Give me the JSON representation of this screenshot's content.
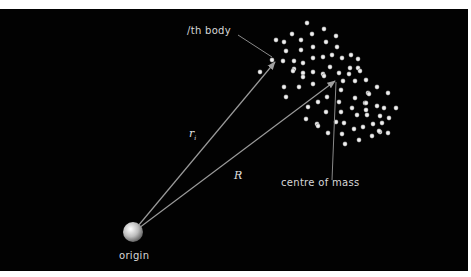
{
  "diagram": {
    "labels": {
      "ith_body": "/th body",
      "centre_of_mass": "centre of mass",
      "origin": "origin",
      "r_i": "r",
      "r_i_sub": "i",
      "R": "R"
    },
    "colors": {
      "background": "#020202",
      "border": "#ffffff",
      "vector": "#9a9a9a",
      "particle": "#e6e6e6",
      "text": "#d8d8d8"
    },
    "particles": [
      [
        307,
        23
      ],
      [
        292,
        34
      ],
      [
        301,
        40
      ],
      [
        276,
        40
      ],
      [
        284,
        42
      ],
      [
        312,
        34
      ],
      [
        286,
        51
      ],
      [
        301,
        50
      ],
      [
        272,
        60
      ],
      [
        283,
        61
      ],
      [
        294,
        61
      ],
      [
        303,
        63
      ],
      [
        260,
        72
      ],
      [
        294,
        69
      ],
      [
        303,
        73
      ],
      [
        313,
        47
      ],
      [
        313,
        58
      ],
      [
        313,
        72
      ],
      [
        324,
        29
      ],
      [
        336,
        36
      ],
      [
        326,
        42
      ],
      [
        337,
        47
      ],
      [
        323,
        57
      ],
      [
        332,
        55
      ],
      [
        342,
        58
      ],
      [
        351,
        55
      ],
      [
        358,
        59
      ],
      [
        330,
        67
      ],
      [
        350,
        68
      ],
      [
        358,
        68
      ],
      [
        323,
        74
      ],
      [
        339,
        73
      ],
      [
        293,
        71
      ],
      [
        303,
        77
      ],
      [
        284,
        87
      ],
      [
        299,
        87
      ],
      [
        313,
        84
      ],
      [
        286,
        97
      ],
      [
        308,
        107
      ],
      [
        306,
        119
      ],
      [
        324,
        76
      ],
      [
        349,
        74
      ],
      [
        360,
        71
      ],
      [
        343,
        81
      ],
      [
        355,
        81
      ],
      [
        366,
        80
      ],
      [
        341,
        90
      ],
      [
        368,
        93
      ],
      [
        318,
        102
      ],
      [
        327,
        97
      ],
      [
        339,
        102
      ],
      [
        355,
        98
      ],
      [
        352,
        108
      ],
      [
        365,
        103
      ],
      [
        326,
        112
      ],
      [
        341,
        112
      ],
      [
        357,
        115
      ],
      [
        367,
        115
      ],
      [
        317,
        124
      ],
      [
        336,
        122
      ],
      [
        344,
        123
      ],
      [
        363,
        127
      ],
      [
        354,
        129
      ],
      [
        377,
        87
      ],
      [
        369,
        94
      ],
      [
        388,
        93
      ],
      [
        366,
        103
      ],
      [
        366,
        110
      ],
      [
        377,
        106
      ],
      [
        384,
        108
      ],
      [
        396,
        108
      ],
      [
        380,
        116
      ],
      [
        389,
        118
      ],
      [
        373,
        124
      ],
      [
        382,
        123
      ],
      [
        380,
        132
      ],
      [
        388,
        133
      ],
      [
        372,
        136
      ],
      [
        318,
        126
      ],
      [
        328,
        133
      ],
      [
        342,
        134
      ],
      [
        345,
        144
      ],
      [
        359,
        140
      ],
      [
        379,
        131
      ]
    ]
  }
}
